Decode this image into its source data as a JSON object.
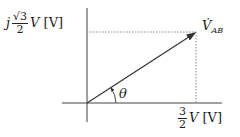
{
  "diagram": {
    "type": "phasor",
    "imag_label": {
      "j": "j",
      "num": "√3",
      "den": "2",
      "var": "V",
      "unit": "[V]"
    },
    "real_label": {
      "num": "3",
      "den": "2",
      "var": "V",
      "unit": "[V]"
    },
    "phasor_label": {
      "main": "V̇",
      "sub": "AB"
    },
    "angle_label": "θ",
    "colors": {
      "line": "#333333",
      "dotted": "#888888"
    }
  }
}
